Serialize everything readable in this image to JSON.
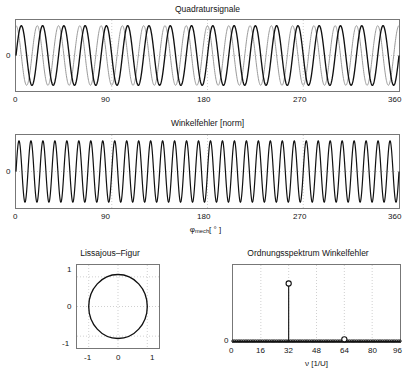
{
  "figure": {
    "kind": "matlab-multi-axes-figure",
    "background": "#ffffff",
    "line_colors": {
      "primary": "#111111",
      "secondary": "#9a9a9a",
      "axis": "#777777",
      "grid": "#bbbbbb"
    }
  },
  "panels": {
    "quadrature": {
      "title": "Quadratursignale",
      "xticks": [
        "0",
        "90",
        "180",
        "270",
        "360"
      ],
      "yticks": [
        "0"
      ]
    },
    "angle_error": {
      "title": "Winkelfehler [norm]",
      "xticks": [
        "0",
        "90",
        "180",
        "270",
        "360"
      ],
      "yticks": [
        "0"
      ],
      "xlabel_main": "φ",
      "xlabel_sub": "mech",
      "xlabel_unit": "[ ° ]"
    },
    "lissajous": {
      "title": "Lissajous–Figur",
      "xticks": [
        "-1",
        "0",
        "1"
      ],
      "yticks": [
        "1",
        "0",
        "-1"
      ]
    },
    "spectrum": {
      "title": "Ordnungsspektrum Winkelfehler",
      "xticks": [
        "0",
        "16",
        "32",
        "48",
        "64",
        "80",
        "96"
      ],
      "yticks": [
        "0"
      ],
      "xlabel_main": "ν",
      "xlabel_unit": "[1/U]"
    }
  },
  "chart_data": [
    {
      "id": "quadrature",
      "type": "line",
      "title": "Quadratursignale",
      "xlabel": "",
      "ylabel": "",
      "xlim": [
        0,
        360
      ],
      "ylim": [
        -1.25,
        1.25
      ],
      "xticks": [
        0,
        90,
        180,
        270,
        360
      ],
      "yticks": [
        0
      ],
      "grid": true,
      "series": [
        {
          "name": "sin-channel",
          "color": "#111111",
          "cycles": 18,
          "amplitude": 1.0,
          "phase_deg": 0
        },
        {
          "name": "cos-channel",
          "color": "#9a9a9a",
          "cycles": 18,
          "amplitude": 1.0,
          "phase_deg": 90
        }
      ]
    },
    {
      "id": "angle_error",
      "type": "line",
      "title": "Winkelfehler [norm]",
      "xlabel": "φ_mech [°]",
      "ylabel": "",
      "xlim": [
        0,
        360
      ],
      "ylim": [
        -1.25,
        1.25
      ],
      "xticks": [
        0,
        90,
        180,
        270,
        360
      ],
      "yticks": [
        0
      ],
      "grid": true,
      "series": [
        {
          "name": "winkelfehler",
          "color": "#111111",
          "cycles": 32,
          "amplitude": 1.0,
          "phase_deg": 0
        }
      ]
    },
    {
      "id": "lissajous",
      "type": "line",
      "title": "Lissajous–Figur",
      "xlabel": "",
      "ylabel": "",
      "xlim": [
        -1.4,
        1.4
      ],
      "ylim": [
        -1.4,
        1.4
      ],
      "xticks": [
        -1,
        0,
        1
      ],
      "yticks": [
        -1,
        0,
        1
      ],
      "grid": true,
      "series": [
        {
          "name": "lissajous-ellipse",
          "color": "#111111",
          "rx": 1.0,
          "ry": 1.08
        }
      ]
    },
    {
      "id": "spectrum",
      "type": "bar",
      "title": "Ordnungsspektrum Winkelfehler",
      "xlabel": "ν [1/U]",
      "ylabel": "",
      "xlim": [
        0,
        96
      ],
      "ylim": [
        0,
        1.0
      ],
      "xticks": [
        0,
        16,
        32,
        48,
        64,
        80,
        96
      ],
      "yticks": [
        0
      ],
      "grid": true,
      "categories": [
        32,
        64
      ],
      "values": [
        0.76,
        0.035
      ],
      "markers": "circle",
      "baseline_noise": 0.012
    }
  ]
}
